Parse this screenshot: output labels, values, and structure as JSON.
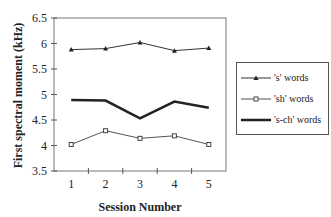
{
  "chart_data": {
    "type": "line",
    "title": "",
    "xlabel": "Session Number",
    "ylabel": "First spectral moment (kHz)",
    "categories": [
      "1",
      "2",
      "3",
      "4",
      "5"
    ],
    "x": [
      1,
      2,
      3,
      4,
      5
    ],
    "ylim": [
      3.5,
      6.5
    ],
    "yticks": [
      "3.5",
      "4",
      "4.5",
      "5",
      "5.5",
      "6",
      "6.5"
    ],
    "grid": false,
    "legend_position": "right",
    "series": [
      {
        "name": "'s' words",
        "marker": "triangle",
        "line": "thin",
        "color": "#333333",
        "values": [
          5.88,
          5.9,
          6.02,
          5.86,
          5.91
        ]
      },
      {
        "name": "'sh' words",
        "marker": "open-square",
        "line": "thin",
        "color": "#555555",
        "values": [
          4.02,
          4.29,
          4.14,
          4.19,
          4.02
        ]
      },
      {
        "name": "'s-ch' words",
        "marker": "none",
        "line": "thick",
        "color": "#222222",
        "values": [
          4.89,
          4.88,
          4.53,
          4.86,
          4.74
        ]
      }
    ]
  }
}
